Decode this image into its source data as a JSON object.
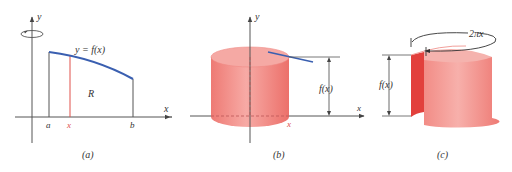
{
  "figure": {
    "panels": [
      {
        "id": "a",
        "caption": "(a)",
        "axis_labels": {
          "y": "y",
          "x": "x"
        },
        "curve_label": "y = f(x)",
        "region_label": "R",
        "tick_labels": {
          "a": "a",
          "x": "x",
          "b": "b"
        }
      },
      {
        "id": "b",
        "caption": "(b)",
        "axis_labels": {
          "y": "y",
          "x": "x"
        },
        "height_label": "f(x)"
      },
      {
        "id": "c",
        "caption": "(c)",
        "axis_labels": {
          "x": "x"
        },
        "height_label": "f(x)",
        "circumference_label": "2πx"
      }
    ],
    "colors": {
      "axis": "#555555",
      "curve": "#3a5fb0",
      "strip": "#e0504a",
      "cylinder_body": "#f08a85",
      "cylinder_top": "#f4a7a2",
      "cylinder_inner": "#e2403c"
    }
  }
}
